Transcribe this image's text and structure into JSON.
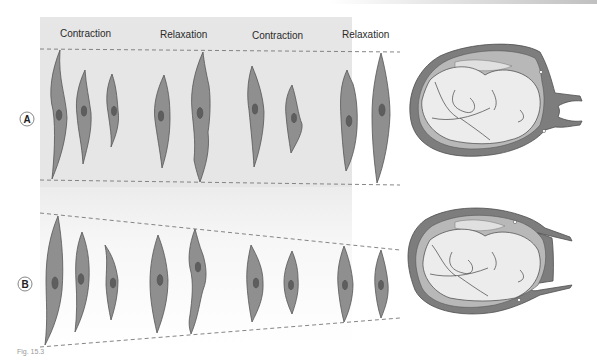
{
  "figure": {
    "column_labels": [
      "Contraction",
      "Relaxation",
      "Contraction",
      "Relaxation"
    ],
    "row_labels": [
      "A",
      "B"
    ],
    "colors": {
      "panel_a_bg": "#e4e4e4",
      "panel_b_bg": "#f6f6f6",
      "cell_fill": "#8f8f8f",
      "cell_outline": "#555555",
      "nucleus_fill": "#5e5e5e",
      "dashed_line": "#7a7a7a",
      "uterus_wall": "#7d7d7d",
      "uterus_inner": "#b8b8b8",
      "fetus_fill": "#e8e8e8",
      "top_band": "#c8c8c8"
    },
    "caption": "Fig. 15.3"
  }
}
